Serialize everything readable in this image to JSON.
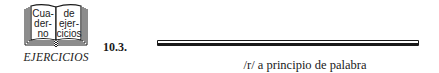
{
  "icon": {
    "name": "book-icon",
    "left_page_lines": [
      "Cua-",
      "der-",
      "no"
    ],
    "right_page_lines": [
      "de",
      "ejer-",
      "cicios"
    ]
  },
  "section_label": "EJERCICIOS",
  "exercise": {
    "number": "10.3.",
    "title": "/r/ a principio de palabra"
  },
  "colors": {
    "ink": "#1a1a1a",
    "background": "#ffffff"
  }
}
